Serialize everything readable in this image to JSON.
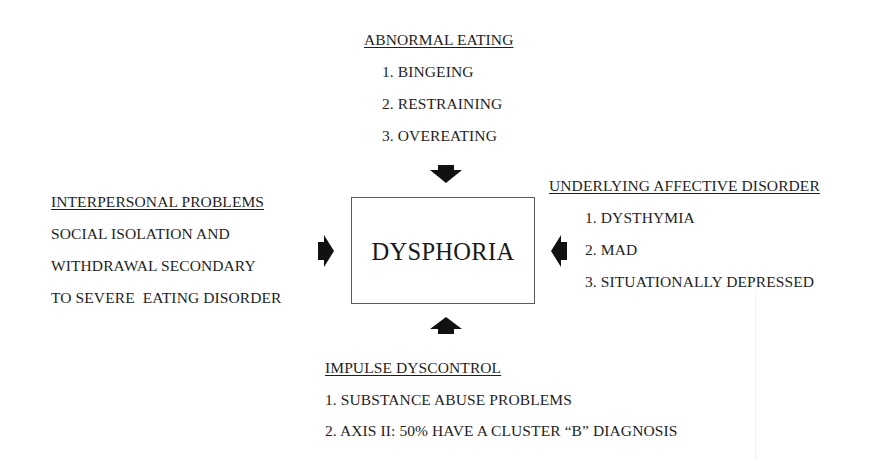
{
  "diagram": {
    "center": {
      "label": "DYSPHORIA"
    },
    "top": {
      "heading": "ABNORMAL EATING",
      "items": [
        "1. BINGEING",
        "2. RESTRAINING",
        "3. OVEREATING"
      ]
    },
    "left": {
      "heading": "INTERPERSONAL PROBLEMS",
      "lines": [
        "SOCIAL ISOLATION AND",
        "WITHDRAWAL SECONDARY",
        "TO SEVERE  EATING DISORDER"
      ]
    },
    "right": {
      "heading": "UNDERLYING AFFECTIVE DISORDER",
      "items": [
        "1. DYSTHYMIA",
        "2. MAD",
        "3. SITUATIONALLY DEPRESSED"
      ]
    },
    "bottom": {
      "heading": "IMPULSE DYSCONTROL",
      "items": [
        "1. SUBSTANCE ABUSE PROBLEMS",
        "2. AXIS II: 50% HAVE A CLUSTER “B” DIAGNOSIS"
      ]
    },
    "arrows": [
      {
        "from": "top",
        "direction": "down"
      },
      {
        "from": "left",
        "direction": "right"
      },
      {
        "from": "right",
        "direction": "left"
      },
      {
        "from": "bottom",
        "direction": "up"
      }
    ],
    "colors": {
      "text": "#1e1e1e",
      "arrow": "#111111",
      "box_border": "#5a5a5a",
      "background": "#ffffff"
    }
  }
}
